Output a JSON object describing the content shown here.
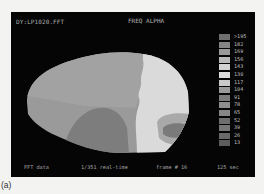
{
  "screen": {
    "header": {
      "file_label": "DY:LP1020.FFT",
      "mode_label": "FREQ ALPHA"
    },
    "map": {
      "view": "lateral brain topographic map",
      "colors": {
        "background": "#050505",
        "base_region": "#9a9a9a",
        "upper_region": "#a0a0a0",
        "low_region": "#7c7c7c",
        "bright_region": "#dcdcdc",
        "dark_patch": "#7a7a7a",
        "patch_halo": "#a8a8a8"
      }
    },
    "legend": {
      "items": [
        {
          "label": ">195",
          "color": "#6f6f6f"
        },
        {
          "label": "182",
          "color": "#848484"
        },
        {
          "label": "169",
          "color": "#999999"
        },
        {
          "label": "156",
          "color": "#b9b9b9"
        },
        {
          "label": "143",
          "color": "#d2d2d2"
        },
        {
          "label": "130",
          "color": "#dcdcdc"
        },
        {
          "label": "117",
          "color": "#c9c9c9"
        },
        {
          "label": "104",
          "color": "#9a9a9a"
        },
        {
          "label": "91",
          "color": "#7b7b7b"
        },
        {
          "label": "78",
          "color": "#8e8e8e"
        },
        {
          "label": "65",
          "color": "#868686"
        },
        {
          "label": "52",
          "color": "#6e6e6e"
        },
        {
          "label": "39",
          "color": "#777777"
        },
        {
          "label": "26",
          "color": "#6a6a6a"
        },
        {
          "label": "13",
          "color": "#5c5c5c"
        }
      ]
    },
    "footer": {
      "data_type": "FFT  data",
      "progress": "1/351 real-time",
      "frame": "frame #  16",
      "time": "125 sec"
    }
  },
  "caption": "(a)"
}
